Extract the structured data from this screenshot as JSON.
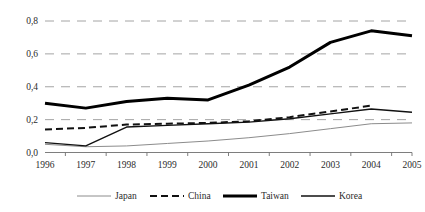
{
  "chart_data": {
    "type": "line",
    "title": "",
    "subtitle": "",
    "xlabel": "",
    "ylabel": "",
    "categories": [
      "1996",
      "1997",
      "1998",
      "1999",
      "2000",
      "2001",
      "2002",
      "2003",
      "2004",
      "2005"
    ],
    "x": [
      1996,
      1997,
      1998,
      1999,
      2000,
      2001,
      2002,
      2003,
      2004,
      2005
    ],
    "ylim": [
      0.0,
      0.8
    ],
    "ytick_values": [
      0.0,
      0.2,
      0.4,
      0.6,
      0.8
    ],
    "ytick_labels": [
      "0,0",
      "0,2",
      "0,4",
      "0,6",
      "0,8"
    ],
    "grid": "horizontal-dashed",
    "legend_position": "bottom-center",
    "decimal_separator": ",",
    "series": [
      {
        "name": "Japan",
        "style": "solid-thin-gray",
        "color": "#8c8c8c",
        "width": 1.0,
        "values": [
          0.05,
          0.035,
          0.04,
          0.055,
          0.07,
          0.09,
          0.115,
          0.145,
          0.175,
          0.18
        ]
      },
      {
        "name": "China",
        "style": "dashed-black",
        "color": "#111111",
        "width": 2.0,
        "dash": "7,4",
        "values": [
          0.14,
          0.15,
          0.17,
          0.175,
          0.18,
          0.19,
          0.215,
          0.25,
          0.285,
          null
        ]
      },
      {
        "name": "Taiwan",
        "style": "solid-thick-black",
        "color": "#000000",
        "width": 3.0,
        "values": [
          0.3,
          0.27,
          0.31,
          0.33,
          0.32,
          0.41,
          0.52,
          0.67,
          0.74,
          0.71
        ]
      },
      {
        "name": "Korea",
        "style": "solid-thin-black",
        "color": "#111111",
        "width": 1.4,
        "values": [
          0.06,
          0.04,
          0.155,
          0.165,
          0.175,
          0.185,
          0.205,
          0.235,
          0.265,
          0.245
        ]
      }
    ]
  },
  "axis": {
    "y_labels": [
      "0,8",
      "0,6",
      "0,4",
      "0,2",
      "0,0"
    ],
    "x_labels": [
      "1996",
      "1997",
      "1998",
      "1999",
      "2000",
      "2001",
      "2002",
      "2003",
      "2004",
      "2005"
    ]
  },
  "legend": {
    "items": [
      {
        "label": "Japan",
        "swatch": "line-swatch-japan"
      },
      {
        "label": "China",
        "swatch": "line-swatch-china"
      },
      {
        "label": "Taiwan",
        "swatch": "line-swatch-taiwan"
      },
      {
        "label": "Korea",
        "swatch": "line-swatch-korea"
      }
    ]
  },
  "colors": {
    "japan": "#8c8c8c",
    "china": "#111111",
    "taiwan": "#000000",
    "korea": "#111111",
    "grid": "#9a9a9a",
    "axis": "#6f6f6f",
    "text": "#2b2b2b",
    "background": "#ffffff"
  }
}
